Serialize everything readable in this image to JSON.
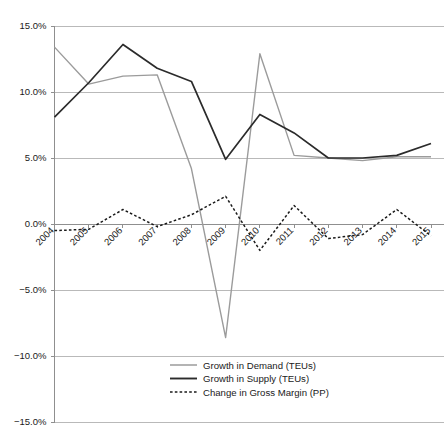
{
  "chart_data": {
    "type": "line",
    "title": "",
    "subtitle": "",
    "xlabel": "",
    "ylabel": "",
    "ylim": [
      -15,
      15
    ],
    "ytick_values": [
      15,
      10,
      5,
      0,
      -5,
      -10,
      -15
    ],
    "ytick_labels": [
      "15.0%",
      "10.0%",
      "5.0%",
      "0.0%",
      "-5.0%",
      "-10.0%",
      "-15.0%"
    ],
    "grid": true,
    "legend_position": "bottom-center",
    "categories": [
      "2004",
      "2005",
      "2006",
      "2007",
      "2008",
      "2009",
      "2010",
      "2011",
      "2012",
      "2013",
      "2014",
      "2015"
    ],
    "series": [
      {
        "name": "Growth in Demand (TEUs)",
        "color": "#9b9b9b",
        "style": "solid",
        "values": [
          13.4,
          10.6,
          11.2,
          11.3,
          4.2,
          -8.6,
          12.9,
          5.2,
          5.0,
          4.8,
          5.1,
          5.1
        ]
      },
      {
        "name": "Growth in Supply (TEUs)",
        "color": "#2b2b2b",
        "style": "solid",
        "values": [
          8.1,
          10.7,
          13.6,
          11.8,
          10.8,
          4.9,
          8.3,
          6.9,
          5.0,
          5.0,
          5.2,
          6.1
        ]
      },
      {
        "name": "Change in Gross Margin (PP)",
        "color": "#1a1a1a",
        "style": "dashed",
        "values": [
          -0.5,
          -0.4,
          1.1,
          -0.2,
          0.7,
          2.1,
          -2.0,
          1.4,
          -1.1,
          -0.8,
          1.1,
          -0.9
        ]
      }
    ]
  },
  "legend": {
    "items": [
      {
        "label": "Growth in Demand (TEUs)"
      },
      {
        "label": "Growth in Supply (TEUs)"
      },
      {
        "label": "Change in Gross Margin (PP)"
      }
    ]
  }
}
